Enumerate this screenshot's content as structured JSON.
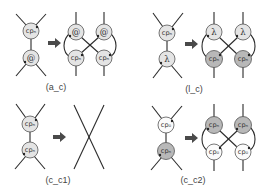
{
  "diagram": {
    "type": "interaction-net rewrite rules",
    "rules": [
      {
        "id": "a_c",
        "caption": "(a_c)",
        "lhs": {
          "top": "cpₙ",
          "bottom": "@"
        },
        "rhs": {
          "top_left": "@",
          "top_right": "@",
          "bottom_left": "cpₙ",
          "bottom_right": "cpₙ"
        }
      },
      {
        "id": "l_c",
        "caption": "(l_c)",
        "lhs": {
          "top": "cpₙ",
          "bottom": "λ"
        },
        "rhs": {
          "top_left": "λ",
          "top_right": "λ",
          "bottom_left": "cpₙ",
          "bottom_right": "cpₙ"
        }
      },
      {
        "id": "c_c1",
        "caption": "(c_c1)",
        "lhs": {
          "top": "cpₙ",
          "bottom": "cpₙ"
        },
        "rhs": {
          "result": "crossed wires"
        }
      },
      {
        "id": "c_c2",
        "caption": "(c_c2)",
        "lhs": {
          "top": "cp₀",
          "bottom": "cpₙ"
        },
        "rhs": {
          "top_left": "cpₙ",
          "top_right": "cpₙ",
          "bottom_left": "cp₀",
          "bottom_right": "cp₀"
        }
      }
    ],
    "arrow_symbol": "➡",
    "colors": {
      "light_node": "#e4e4e4",
      "dark_node": "#b8b8b8",
      "white_node": "#fbfbfb",
      "line": "#2a2a2a"
    }
  }
}
